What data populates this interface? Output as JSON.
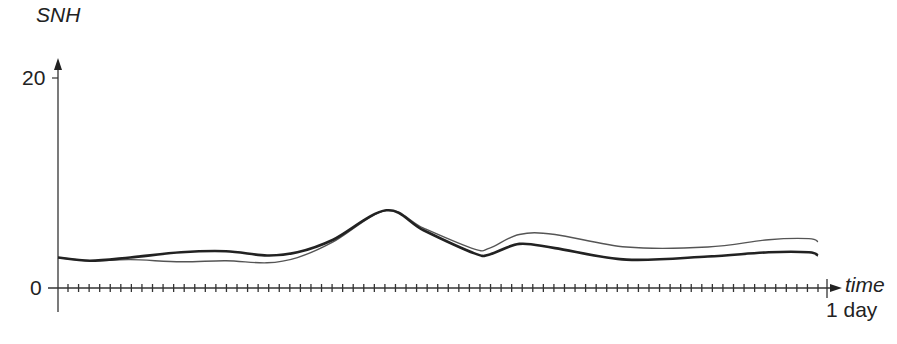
{
  "chart_data": {
    "type": "line",
    "title": "",
    "xlabel": "time",
    "ylabel": "SNH",
    "x_end_label": "1 day",
    "y_ticks": [
      "0",
      "20"
    ],
    "ylim": [
      0,
      20
    ],
    "xlim": [
      0,
      1
    ],
    "grid": false,
    "legend": null,
    "x_minor_ticks": 72,
    "x": [
      0.0,
      0.042,
      0.095,
      0.162,
      0.221,
      0.275,
      0.315,
      0.362,
      0.432,
      0.481,
      0.548,
      0.568,
      0.607,
      0.654,
      0.748,
      0.855,
      0.935,
      0.988,
      1.0
    ],
    "series": [
      {
        "name": "series-thick",
        "style": "thick dark line",
        "values": [
          2.9,
          2.6,
          2.9,
          3.4,
          3.5,
          3.1,
          3.4,
          4.6,
          7.4,
          5.5,
          3.3,
          3.2,
          4.2,
          3.8,
          2.7,
          3.0,
          3.4,
          3.4,
          3.1
        ]
      },
      {
        "name": "series-thin",
        "style": "thin gray line",
        "values": [
          2.9,
          2.6,
          2.7,
          2.5,
          2.6,
          2.4,
          2.9,
          4.4,
          7.4,
          5.7,
          3.7,
          3.8,
          5.1,
          5.1,
          3.9,
          3.9,
          4.6,
          4.7,
          4.4
        ]
      }
    ]
  },
  "axis": {
    "y_label": "SNH",
    "y_tick_top": "20",
    "y_tick_zero": "0",
    "x_label": "time",
    "x_end": "1 day"
  }
}
